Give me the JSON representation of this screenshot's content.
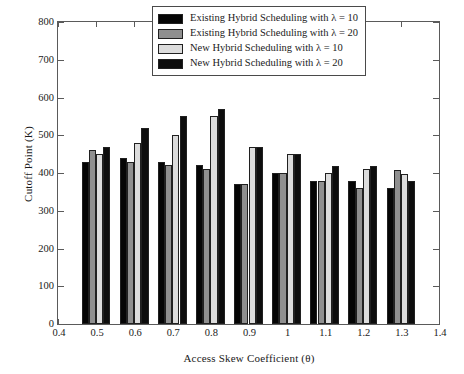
{
  "chart_data": {
    "type": "bar",
    "title": "",
    "xlabel": "Access Skew Coefficient (θ)",
    "ylabel": "Cutoff Point (K)",
    "xlim": [
      0.4,
      1.4
    ],
    "ylim": [
      0,
      800
    ],
    "ytick_step": 100,
    "xtick_step": 0.1,
    "grid": false,
    "legend_position": "top-right-inside",
    "categories": [
      "0.5",
      "0.6",
      "0.7",
      "0.8",
      "0.9",
      "1",
      "1.1",
      "1.2",
      "1.3"
    ],
    "xticklabels": [
      "0.4",
      "0.5",
      "0.6",
      "0.7",
      "0.8",
      "0.9",
      "1",
      "1.1",
      "1.2",
      "1.3",
      "1.4"
    ],
    "yticklabels": [
      "0",
      "100",
      "200",
      "300",
      "400",
      "500",
      "600",
      "700",
      "800"
    ],
    "series": [
      {
        "name": "Existing Hybrid Scheduling with λ = 10",
        "color": "#050505",
        "values": [
          430,
          440,
          430,
          420,
          370,
          400,
          380,
          380,
          360
        ]
      },
      {
        "name": "Existing Hybrid Scheduling with λ = 20",
        "color": "#8f8f8f",
        "values": [
          460,
          430,
          420,
          410,
          370,
          400,
          380,
          360,
          408
        ]
      },
      {
        "name": "New Hybrid Scheduling with λ = 10",
        "color": "#dcdcdc",
        "values": [
          450,
          480,
          500,
          550,
          470,
          450,
          400,
          410,
          398
        ]
      },
      {
        "name": "New Hybrid Scheduling with λ = 20",
        "color": "#0d0d0d",
        "values": [
          470,
          520,
          550,
          570,
          470,
          450,
          418,
          418,
          380
        ]
      }
    ]
  }
}
